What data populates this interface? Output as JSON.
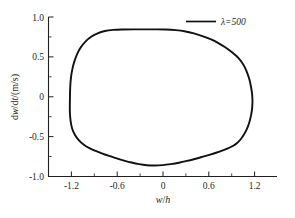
{
  "chart_data": {
    "type": "line",
    "title": "",
    "subtitle": "",
    "xlabel": "w/h",
    "ylabel": "dw/dt/(m/s)",
    "xlim": [
      -1.5,
      1.5
    ],
    "ylim": [
      -1.0,
      1.0
    ],
    "xticks": [
      "-1.2",
      "-0.6",
      "0",
      "0.6",
      "1.2"
    ],
    "xtick_values": [
      -1.2,
      -0.6,
      0,
      0.6,
      1.2
    ],
    "yticks": [
      "1.0",
      "0.5",
      "0",
      "-0.5",
      "-1.0"
    ],
    "ytick_values": [
      1.0,
      0.5,
      0,
      -0.5,
      -1.0
    ],
    "grid": false,
    "legend_position": "top-right",
    "legend": [
      {
        "label": "λ=500",
        "symbol": "solid-line",
        "color": "#111111"
      }
    ],
    "series": [
      {
        "name": "λ=500",
        "closed": true,
        "description": "closed limit cycle / phase portrait orbit",
        "points": [
          [
            -1.218,
            0.0
          ],
          [
            -1.215,
            0.12
          ],
          [
            -1.205,
            0.24
          ],
          [
            -1.186,
            0.35
          ],
          [
            -1.158,
            0.45
          ],
          [
            -1.12,
            0.545
          ],
          [
            -1.072,
            0.625
          ],
          [
            -1.012,
            0.695
          ],
          [
            -0.94,
            0.752
          ],
          [
            -0.855,
            0.796
          ],
          [
            -0.76,
            0.824
          ],
          [
            -0.65,
            0.838
          ],
          [
            -0.52,
            0.843
          ],
          [
            -0.38,
            0.845
          ],
          [
            -0.24,
            0.845
          ],
          [
            -0.1,
            0.845
          ],
          [
            0.04,
            0.843
          ],
          [
            0.17,
            0.835
          ],
          [
            0.3,
            0.818
          ],
          [
            0.42,
            0.792
          ],
          [
            0.53,
            0.758
          ],
          [
            0.635,
            0.718
          ],
          [
            0.73,
            0.672
          ],
          [
            0.815,
            0.624
          ],
          [
            0.888,
            0.575
          ],
          [
            0.948,
            0.527
          ],
          [
            0.998,
            0.482
          ],
          [
            1.04,
            0.43
          ],
          [
            1.078,
            0.368
          ],
          [
            1.11,
            0.296
          ],
          [
            1.138,
            0.215
          ],
          [
            1.158,
            0.128
          ],
          [
            1.172,
            0.042
          ],
          [
            1.178,
            -0.048
          ],
          [
            1.174,
            -0.14
          ],
          [
            1.16,
            -0.23
          ],
          [
            1.138,
            -0.316
          ],
          [
            1.108,
            -0.396
          ],
          [
            1.07,
            -0.468
          ],
          [
            1.026,
            -0.53
          ],
          [
            0.976,
            -0.58
          ],
          [
            0.92,
            -0.618
          ],
          [
            0.855,
            -0.648
          ],
          [
            0.78,
            -0.676
          ],
          [
            0.7,
            -0.702
          ],
          [
            0.612,
            -0.728
          ],
          [
            0.518,
            -0.754
          ],
          [
            0.42,
            -0.78
          ],
          [
            0.318,
            -0.805
          ],
          [
            0.212,
            -0.828
          ],
          [
            0.105,
            -0.845
          ],
          [
            0.0,
            -0.857
          ],
          [
            -0.105,
            -0.862
          ],
          [
            -0.208,
            -0.858
          ],
          [
            -0.31,
            -0.845
          ],
          [
            -0.41,
            -0.825
          ],
          [
            -0.508,
            -0.8
          ],
          [
            -0.605,
            -0.772
          ],
          [
            -0.7,
            -0.742
          ],
          [
            -0.792,
            -0.712
          ],
          [
            -0.88,
            -0.68
          ],
          [
            -0.962,
            -0.645
          ],
          [
            -1.036,
            -0.602
          ],
          [
            -1.1,
            -0.548
          ],
          [
            -1.152,
            -0.48
          ],
          [
            -1.19,
            -0.398
          ],
          [
            -1.21,
            -0.302
          ],
          [
            -1.219,
            -0.2
          ],
          [
            -1.22,
            -0.098
          ],
          [
            -1.218,
            0.0
          ]
        ]
      }
    ]
  },
  "axes": {
    "x_title": "w/h",
    "x_title_parts": {
      "var1": "w",
      "slash": "/",
      "var2": "h"
    },
    "y_title": "dw/dt/(m/s)",
    "y_title_parts": {
      "d1": "d",
      "w": "w",
      "slash1": "/d",
      "t": "t",
      "tail": "/(m/s)"
    }
  }
}
